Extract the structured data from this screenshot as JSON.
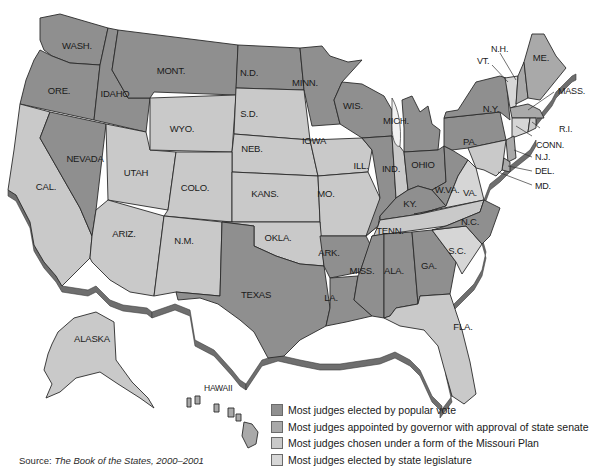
{
  "colors": {
    "popular_vote": "#8f8f8f",
    "governor_senate": "#a9a9a9",
    "missouri_plan": "#c9c9c9",
    "legislature": "#d6d6d6",
    "background": "#ffffff"
  },
  "states": {
    "wash": {
      "label": "WASH.",
      "category": "popular_vote"
    },
    "ore": {
      "label": "ORE.",
      "category": "popular_vote"
    },
    "idaho": {
      "label": "IDAHO",
      "category": "popular_vote"
    },
    "mont": {
      "label": "MONT.",
      "category": "popular_vote"
    },
    "nd": {
      "label": "N.D.",
      "category": "popular_vote"
    },
    "minn": {
      "label": "MINN.",
      "category": "popular_vote"
    },
    "wis": {
      "label": "WIS.",
      "category": "popular_vote"
    },
    "mich": {
      "label": "MICH.",
      "category": "popular_vote"
    },
    "cal": {
      "label": "CAL.",
      "category": "missouri_plan"
    },
    "nevada": {
      "label": "NEVADA",
      "category": "popular_vote"
    },
    "utah": {
      "label": "UTAH",
      "category": "missouri_plan"
    },
    "wyo": {
      "label": "WYO.",
      "category": "missouri_plan"
    },
    "sd": {
      "label": "S.D.",
      "category": "missouri_plan"
    },
    "neb": {
      "label": "NEB.",
      "category": "missouri_plan"
    },
    "iowa": {
      "label": "IOWA",
      "category": "missouri_plan"
    },
    "colo": {
      "label": "COLO.",
      "category": "missouri_plan"
    },
    "kans": {
      "label": "KANS.",
      "category": "missouri_plan"
    },
    "mo": {
      "label": "MO.",
      "category": "missouri_plan"
    },
    "ill": {
      "label": "ILL.",
      "category": "popular_vote"
    },
    "ind": {
      "label": "IND.",
      "category": "missouri_plan"
    },
    "ohio": {
      "label": "OHIO",
      "category": "popular_vote"
    },
    "ky": {
      "label": "KY.",
      "category": "popular_vote"
    },
    "wva": {
      "label": "W.VA.",
      "category": "popular_vote"
    },
    "va": {
      "label": "VA.",
      "category": "legislature"
    },
    "pa": {
      "label": "PA.",
      "category": "popular_vote"
    },
    "ny": {
      "label": "N.Y.",
      "category": "popular_vote"
    },
    "vt": {
      "label": "VT.",
      "category": "legislature"
    },
    "nh": {
      "label": "N.H.",
      "category": "governor_senate"
    },
    "me": {
      "label": "ME.",
      "category": "governor_senate"
    },
    "mass": {
      "label": "MASS.",
      "category": "governor_senate"
    },
    "ri": {
      "label": "R.I.",
      "category": "missouri_plan"
    },
    "conn": {
      "label": "CONN.",
      "category": "legislature"
    },
    "nj": {
      "label": "N.J.",
      "category": "governor_senate"
    },
    "del": {
      "label": "DEL.",
      "category": "governor_senate"
    },
    "md": {
      "label": "MD.",
      "category": "missouri_plan"
    },
    "ariz": {
      "label": "ARIZ.",
      "category": "missouri_plan"
    },
    "nm": {
      "label": "N.M.",
      "category": "missouri_plan"
    },
    "okla": {
      "label": "OKLA.",
      "category": "missouri_plan"
    },
    "texas": {
      "label": "TEXAS",
      "category": "popular_vote"
    },
    "ark": {
      "label": "ARK.",
      "category": "popular_vote"
    },
    "la": {
      "label": "LA.",
      "category": "popular_vote"
    },
    "tenn": {
      "label": "TENN.",
      "category": "missouri_plan"
    },
    "miss": {
      "label": "MISS.",
      "category": "popular_vote"
    },
    "ala": {
      "label": "ALA.",
      "category": "popular_vote"
    },
    "ga": {
      "label": "GA.",
      "category": "popular_vote"
    },
    "sc": {
      "label": "S.C.",
      "category": "legislature"
    },
    "nc": {
      "label": "N.C.",
      "category": "popular_vote"
    },
    "fla": {
      "label": "FLA.",
      "category": "missouri_plan"
    },
    "alaska": {
      "label": "ALASKA",
      "category": "missouri_plan"
    },
    "hawaii": {
      "label": "HAWAII",
      "category": "governor_senate"
    }
  },
  "legend": [
    {
      "key": "popular_vote",
      "label": "Most judges elected by popular vote"
    },
    {
      "key": "governor_senate",
      "label": "Most judges appointed by governor with approval of state senate"
    },
    {
      "key": "missouri_plan",
      "label": "Most judges chosen under a form of the Missouri Plan"
    },
    {
      "key": "legislature",
      "label": "Most judges elected by state legislature"
    }
  ],
  "source": {
    "prefix": "Source: ",
    "title": "The Book of the States, 2000–2001"
  }
}
